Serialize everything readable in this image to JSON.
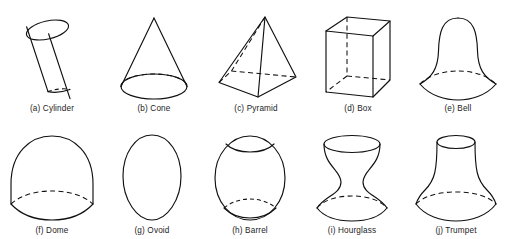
{
  "figure": {
    "background_color": "#ffffff",
    "line_color": "#111111",
    "caption_color": "#1c1c1c",
    "rows": 2,
    "columns": 5,
    "total_shapes": 10
  },
  "shapes": [
    {
      "key": "cylinder",
      "letter": "(a)",
      "name": "Cylinder",
      "caption": "(a) Cylinder",
      "row": 1,
      "column": 1,
      "has_hidden_edges": true,
      "hidden_edge_style": "dashed-ellipse-back"
    },
    {
      "key": "cone",
      "letter": "(b)",
      "name": "Cone",
      "caption": "(b) Cone",
      "row": 1,
      "column": 2,
      "has_hidden_edges": true,
      "hidden_edge_style": "dashed-ellipse-back"
    },
    {
      "key": "pyramid",
      "letter": "(c)",
      "name": "Pyramid",
      "caption": "(c) Pyramid",
      "row": 1,
      "column": 3,
      "has_hidden_edges": true,
      "hidden_edge_style": "dashed-back-edges"
    },
    {
      "key": "box",
      "letter": "(d)",
      "name": "Box",
      "caption": "(d) Box",
      "row": 1,
      "column": 4,
      "has_hidden_edges": true,
      "hidden_edge_style": "dashed-back-edges"
    },
    {
      "key": "bell",
      "letter": "(e)",
      "name": "Bell",
      "caption": "(e) Bell",
      "row": 1,
      "column": 5,
      "has_hidden_edges": true,
      "hidden_edge_style": "dashed-ellipse-back"
    },
    {
      "key": "dome",
      "letter": "(f)",
      "name": "Dome",
      "caption": "(f) Dome",
      "row": 2,
      "column": 1,
      "has_hidden_edges": true,
      "hidden_edge_style": "dashed-ellipse-back"
    },
    {
      "key": "ovoid",
      "letter": "(g)",
      "name": "Ovoid",
      "caption": "(g) Ovoid",
      "row": 2,
      "column": 2,
      "has_hidden_edges": false,
      "hidden_edge_style": "none"
    },
    {
      "key": "barrel",
      "letter": "(h)",
      "name": "Barrel",
      "caption": "(h) Barrel",
      "row": 2,
      "column": 3,
      "has_hidden_edges": true,
      "hidden_edge_style": "dashed-ellipse-back"
    },
    {
      "key": "hourglass",
      "letter": "(i)",
      "name": "Hourglass",
      "caption": "(i) Hourglass",
      "row": 2,
      "column": 4,
      "has_hidden_edges": true,
      "hidden_edge_style": "dashed-ellipse-back"
    },
    {
      "key": "trumpet",
      "letter": "(j)",
      "name": "Trumpet",
      "caption": "(j) Trumpet",
      "row": 2,
      "column": 5,
      "has_hidden_edges": true,
      "hidden_edge_style": "dashed-ellipse-back"
    }
  ]
}
